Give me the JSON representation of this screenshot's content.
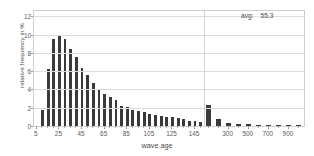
{
  "chart_data": {
    "type": "bar",
    "title": "",
    "subtitle": "",
    "xlabel": "wave age",
    "ylabel": "relative frequency in %",
    "ylim": [
      0,
      12.6
    ],
    "yticks": [
      0,
      2,
      4,
      6,
      8,
      10,
      12
    ],
    "grid": "horizontal-and-vertical",
    "legend": "none",
    "xaxis_note": "binned histogram; bins of 5 up to 150, then coarse bins 150-1000",
    "xticks": [
      "5",
      "25",
      "45",
      "65",
      "85",
      "105",
      "125",
      "145",
      "300",
      "500",
      "700",
      "900"
    ],
    "categories": [
      "5",
      "10",
      "15",
      "20",
      "25",
      "30",
      "35",
      "40",
      "45",
      "50",
      "55",
      "60",
      "65",
      "70",
      "75",
      "80",
      "85",
      "90",
      "95",
      "100",
      "105",
      "110",
      "115",
      "120",
      "125",
      "130",
      "135",
      "140",
      "145",
      "150",
      "200",
      "250",
      "300",
      "400",
      "500",
      "600",
      "700",
      "800",
      "900",
      "1000"
    ],
    "values": [
      0.0,
      1.75,
      6.3,
      9.55,
      10.0,
      9.5,
      8.4,
      7.6,
      6.4,
      5.6,
      4.7,
      4.0,
      3.5,
      3.2,
      2.8,
      2.2,
      2.1,
      1.8,
      1.6,
      1.5,
      1.35,
      1.2,
      1.1,
      1.0,
      0.95,
      0.85,
      0.75,
      0.6,
      0.5,
      0.45,
      2.3,
      0.8,
      0.35,
      0.25,
      0.2,
      0.15,
      0.12,
      0.1,
      0.08,
      0.05
    ],
    "annotations": [
      {
        "key": "avg:",
        "value": "55.3"
      }
    ],
    "colors": {
      "bar": "#3a3a3a",
      "grid": "#dcdcdc",
      "axis": "#cfcfcf",
      "text": "#4a4a4a"
    }
  }
}
